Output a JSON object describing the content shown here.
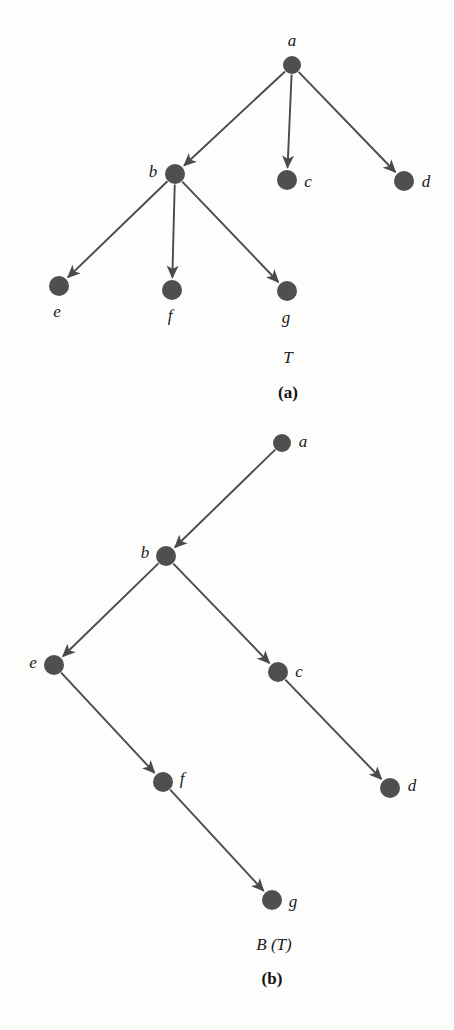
{
  "figure": {
    "background_color": "#fdfdfc",
    "node_color": "#4f4f4f",
    "edge_color": "#4a4a4a",
    "text_color": "#1a1a1a"
  },
  "panel_a": {
    "caption_name": "T",
    "caption_name_pos": {
      "x": 288,
      "y": 358
    },
    "caption_letter": "(a)",
    "caption_letter_pos": {
      "x": 288,
      "y": 393
    },
    "nodes": [
      {
        "id": "a",
        "label": "a",
        "cx": 292,
        "cy": 65,
        "r": 9,
        "label_x": 292,
        "label_y": 40
      },
      {
        "id": "b",
        "label": "b",
        "cx": 175,
        "cy": 174,
        "r": 10,
        "label_x": 153,
        "label_y": 171
      },
      {
        "id": "c",
        "label": "c",
        "cx": 287,
        "cy": 180,
        "r": 10,
        "label_x": 308,
        "label_y": 181
      },
      {
        "id": "d",
        "label": "d",
        "cx": 404,
        "cy": 181,
        "r": 10,
        "label_x": 426,
        "label_y": 181
      },
      {
        "id": "e",
        "label": "e",
        "cx": 59,
        "cy": 286,
        "r": 10,
        "label_x": 57,
        "label_y": 311
      },
      {
        "id": "f",
        "label": "f",
        "cx": 172,
        "cy": 290,
        "r": 10,
        "label_x": 170,
        "label_y": 315
      },
      {
        "id": "g",
        "label": "g",
        "cx": 287,
        "cy": 291,
        "r": 10,
        "label_x": 286,
        "label_y": 317
      }
    ],
    "edges": [
      {
        "from": "a",
        "to": "b"
      },
      {
        "from": "a",
        "to": "c"
      },
      {
        "from": "a",
        "to": "d"
      },
      {
        "from": "b",
        "to": "e"
      },
      {
        "from": "b",
        "to": "f"
      },
      {
        "from": "b",
        "to": "g"
      }
    ]
  },
  "panel_b": {
    "caption_name": "B (T)",
    "caption_name_pos": {
      "x": 274,
      "y": 945
    },
    "caption_letter": "(b)",
    "caption_letter_pos": {
      "x": 272,
      "y": 979
    },
    "nodes": [
      {
        "id": "a",
        "label": "a",
        "cx": 282,
        "cy": 443,
        "r": 9,
        "label_x": 303,
        "label_y": 441
      },
      {
        "id": "b",
        "label": "b",
        "cx": 166,
        "cy": 556,
        "r": 10,
        "label_x": 145,
        "label_y": 552
      },
      {
        "id": "e",
        "label": "e",
        "cx": 54,
        "cy": 665,
        "r": 10,
        "label_x": 33,
        "label_y": 662
      },
      {
        "id": "c",
        "label": "c",
        "cx": 278,
        "cy": 672,
        "r": 10,
        "label_x": 299,
        "label_y": 671
      },
      {
        "id": "f",
        "label": "f",
        "cx": 163,
        "cy": 782,
        "r": 10,
        "label_x": 182,
        "label_y": 778
      },
      {
        "id": "d",
        "label": "d",
        "cx": 390,
        "cy": 788,
        "r": 10,
        "label_x": 412,
        "label_y": 785
      },
      {
        "id": "g",
        "label": "g",
        "cx": 272,
        "cy": 900,
        "r": 10,
        "label_x": 293,
        "label_y": 901
      }
    ],
    "edges": [
      {
        "from": "a",
        "to": "b"
      },
      {
        "from": "b",
        "to": "e"
      },
      {
        "from": "b",
        "to": "c"
      },
      {
        "from": "e",
        "to": "f"
      },
      {
        "from": "c",
        "to": "d"
      },
      {
        "from": "f",
        "to": "g"
      }
    ]
  }
}
